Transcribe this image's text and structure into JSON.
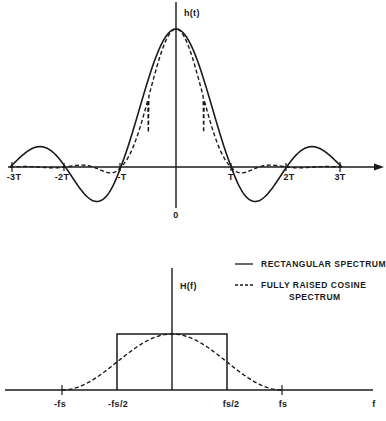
{
  "figure": {
    "top_plot": {
      "ylabel": "h(t)",
      "origin_label": "0",
      "tick_labels": [
        "-3T",
        "-2T",
        "-T",
        "T",
        "2T",
        "3T"
      ]
    },
    "bottom_plot": {
      "ylabel": "H(f)",
      "xlabel": "f",
      "tick_labels": [
        "-fs",
        "-fs/2",
        "fs/2",
        "fs"
      ]
    },
    "legend": {
      "solid": "RECTANGULAR SPECTRUM",
      "dashed_line1": "FULLY RAISED COSINE",
      "dashed_line2": "SPECTRUM"
    },
    "colors": {
      "ink": "#1a1a1a",
      "background": "#ffffff"
    }
  },
  "chart_data": [
    {
      "type": "line",
      "title": "",
      "xlabel": "t",
      "ylabel": "h(t)",
      "x_ticks": [
        "-3T",
        "-2T",
        "-T",
        "0",
        "T",
        "2T",
        "3T"
      ],
      "x_range": [
        -3,
        3
      ],
      "grid": false,
      "series": [
        {
          "name": "RECTANGULAR SPECTRUM (sinc impulse response)",
          "style": "solid",
          "x": [
            -3,
            -2.5,
            -2,
            -1.5,
            -1,
            -0.5,
            0,
            0.5,
            1,
            1.5,
            2,
            2.5,
            3
          ],
          "y": [
            0,
            0.13,
            0,
            -0.21,
            0,
            0.64,
            1,
            0.64,
            0,
            -0.21,
            0,
            0.13,
            0
          ]
        },
        {
          "name": "FULLY RAISED COSINE SPECTRUM",
          "style": "dashed",
          "x": [
            -3,
            -2.5,
            -2,
            -1.5,
            -1,
            -0.5,
            0,
            0.5,
            1,
            1.5,
            2,
            2.5,
            3
          ],
          "y": [
            0,
            -0.01,
            0,
            0.03,
            0,
            0.5,
            1,
            0.5,
            0,
            -0.03,
            0,
            -0.01,
            0
          ]
        }
      ]
    },
    {
      "type": "line",
      "title": "",
      "xlabel": "f",
      "ylabel": "H(f)",
      "x_ticks": [
        "-fs",
        "-fs/2",
        "fs/2",
        "fs"
      ],
      "x_range": [
        -1,
        1
      ],
      "grid": false,
      "legend_position": "upper right",
      "series": [
        {
          "name": "RECTANGULAR SPECTRUM",
          "style": "solid",
          "x": [
            -0.5,
            -0.5,
            0.5,
            0.5
          ],
          "y": [
            0,
            1,
            1,
            0
          ]
        },
        {
          "name": "FULLY RAISED COSINE SPECTRUM",
          "style": "dashed",
          "x": [
            -1,
            -0.75,
            -0.5,
            -0.25,
            0,
            0.25,
            0.5,
            0.75,
            1
          ],
          "y": [
            0,
            0.15,
            0.5,
            0.85,
            1,
            0.85,
            0.5,
            0.15,
            0
          ]
        }
      ]
    }
  ]
}
